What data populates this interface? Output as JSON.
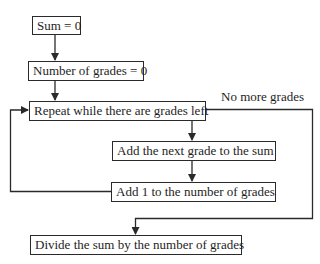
{
  "diagram": {
    "type": "flowchart",
    "nodes": [
      {
        "id": "init-sum",
        "label": "Sum = 0"
      },
      {
        "id": "init-count",
        "label": "Number of grades = 0"
      },
      {
        "id": "loop",
        "label": "Repeat while there are grades left"
      },
      {
        "id": "add-grade",
        "label": "Add the next grade to the sum"
      },
      {
        "id": "increment",
        "label": "Add 1 to the number of grades"
      },
      {
        "id": "divide",
        "label": "Divide the sum by the number of grades"
      }
    ],
    "edge_labels": {
      "exit": "No more grades"
    },
    "edges": [
      {
        "from": "init-sum",
        "to": "init-count"
      },
      {
        "from": "init-count",
        "to": "loop"
      },
      {
        "from": "loop",
        "to": "add-grade"
      },
      {
        "from": "add-grade",
        "to": "increment"
      },
      {
        "from": "increment",
        "to": "loop"
      },
      {
        "from": "loop",
        "to": "divide",
        "label": "No more grades"
      }
    ],
    "colors": {
      "line": "#2a2a2a",
      "text": "#1e1e1e",
      "background": "#ffffff"
    }
  }
}
